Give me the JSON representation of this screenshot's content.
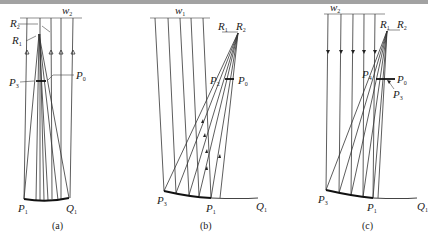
{
  "figure": {
    "panels": [
      {
        "id": "a",
        "caption": "(a)",
        "wavefront": {
          "name": "w",
          "sub": "2"
        },
        "labels": {
          "R2": {
            "name": "R",
            "sub": "2"
          },
          "R1": {
            "name": "R",
            "sub": "1"
          },
          "P3": {
            "name": "P",
            "sub": "3"
          },
          "P0": {
            "name": "P",
            "sub": "0"
          },
          "P1": {
            "name": "P",
            "sub": "1"
          },
          "Q1": {
            "name": "Q",
            "sub": "1"
          }
        }
      },
      {
        "id": "b",
        "caption": "(b)",
        "wavefront": {
          "name": "w",
          "sub": "1"
        },
        "labels": {
          "R1": {
            "name": "R",
            "sub": "1"
          },
          "R2": {
            "name": "R",
            "sub": "2"
          },
          "P2": {
            "name": "P",
            "sub": "2"
          },
          "P0": {
            "name": "P",
            "sub": "0"
          },
          "P3": {
            "name": "P",
            "sub": "3"
          },
          "P1": {
            "name": "P",
            "sub": "1"
          },
          "Q1": {
            "name": "Q",
            "sub": "1"
          }
        }
      },
      {
        "id": "c",
        "caption": "(c)",
        "wavefront": {
          "name": "w",
          "sub": "2"
        },
        "labels": {
          "R1": {
            "name": "R",
            "sub": "1"
          },
          "R2": {
            "name": "R",
            "sub": "2"
          },
          "P4": {
            "name": "P",
            "sub": "4"
          },
          "P0": {
            "name": "P",
            "sub": "0"
          },
          "P3b": {
            "name": "P",
            "sub": "3"
          },
          "P3": {
            "name": "P",
            "sub": "3"
          },
          "P1": {
            "name": "P",
            "sub": "1"
          },
          "Q1": {
            "name": "Q",
            "sub": "1"
          }
        }
      }
    ]
  }
}
